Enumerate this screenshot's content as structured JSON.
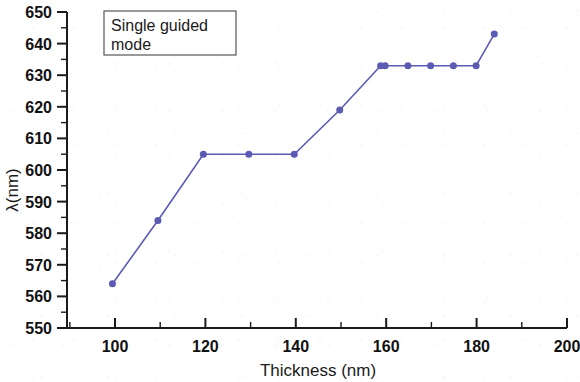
{
  "figure": {
    "background_color": "#ffffff",
    "annotation": {
      "line1": "Single guided",
      "line2": "mode",
      "box_border_color": "#555555"
    }
  },
  "chart_data": {
    "type": "line",
    "title": "",
    "subtitle": "",
    "xlabel": "Thickness (nm)",
    "ylabel": "λ(nm)",
    "xlim": [
      90,
      200
    ],
    "ylim": [
      550,
      650
    ],
    "xticks": [
      100,
      120,
      140,
      160,
      180,
      200
    ],
    "xtick_labels": [
      "100",
      "120",
      "140",
      "160",
      "180",
      "200"
    ],
    "x_minor_ticks": [
      90,
      110,
      130,
      150,
      170,
      190
    ],
    "yticks": [
      550,
      560,
      570,
      580,
      590,
      600,
      610,
      620,
      630,
      640,
      650
    ],
    "ytick_labels": [
      "550",
      "560",
      "570",
      "580",
      "590",
      "600",
      "610",
      "620",
      "630",
      "640",
      "650"
    ],
    "y_minor_ticks": [
      555,
      565,
      575,
      585,
      595,
      605,
      615,
      625,
      635,
      645
    ],
    "grid": false,
    "legend_position": "none",
    "annotations": [
      "Single guided mode"
    ],
    "series": [
      {
        "name": "Single guided mode",
        "color": "#5b5bb4",
        "marker": "circle",
        "marker_size": 7,
        "x": [
          100,
          110,
          120,
          130,
          140,
          150,
          159,
          160,
          165,
          170,
          175,
          180,
          184
        ],
        "y": [
          564,
          584,
          605,
          605,
          605,
          619,
          633,
          633,
          633,
          633,
          633,
          633,
          643
        ]
      }
    ]
  }
}
